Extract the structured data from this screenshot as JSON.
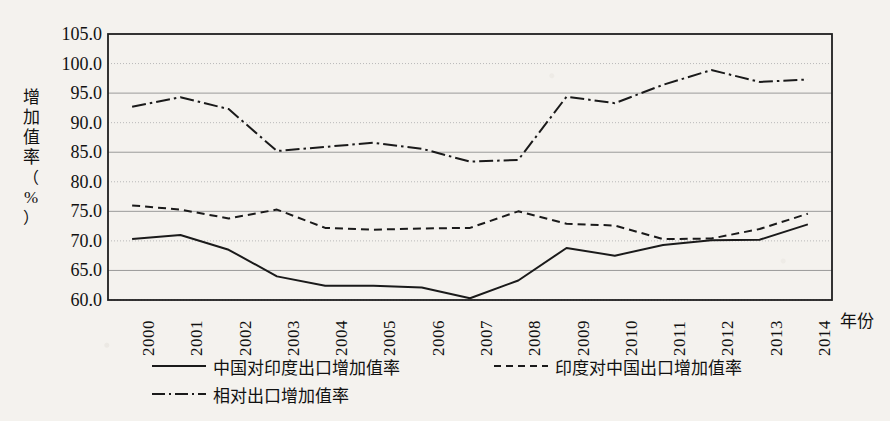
{
  "axes": {
    "y_label_chars": [
      "增",
      "加",
      "值",
      "率",
      "（",
      "%",
      "）"
    ],
    "y_label_full": "增加值率（%）",
    "x_title": "年份",
    "y_ticks": [
      "105.0",
      "100.0",
      "95.0",
      "90.0",
      "85.0",
      "80.0",
      "75.0",
      "70.0",
      "65.0",
      "60.0"
    ]
  },
  "legend": {
    "items": [
      {
        "label": "中国对印度出口增加值率",
        "style": "solid"
      },
      {
        "label": "印度对中国出口增加值率",
        "style": "dashed"
      },
      {
        "label": "相对出口增加值率",
        "style": "dashdot"
      }
    ]
  },
  "chart_data": {
    "type": "line",
    "title": "",
    "xlabel": "年份",
    "ylabel": "增加值率（%）",
    "xlim": [
      2000,
      2014
    ],
    "ylim": [
      60.0,
      105.0
    ],
    "ytick_step": 5.0,
    "grid": true,
    "legend_position": "below",
    "categories": [
      "2000",
      "2001",
      "2002",
      "2003",
      "2004",
      "2005",
      "2006",
      "2007",
      "2008",
      "2009",
      "2010",
      "2011",
      "2012",
      "2013",
      "2014"
    ],
    "series": [
      {
        "name": "中国对印度出口增加值率",
        "style": "solid",
        "color": "#1a1a1a",
        "values": [
          70.3,
          71.0,
          68.5,
          64.0,
          62.4,
          62.4,
          62.1,
          60.3,
          63.3,
          68.8,
          67.5,
          69.3,
          70.1,
          70.2,
          72.8
        ]
      },
      {
        "name": "印度对中国出口增加值率",
        "style": "dashed",
        "color": "#1a1a1a",
        "values": [
          76.0,
          75.3,
          73.8,
          75.3,
          72.2,
          71.9,
          72.1,
          72.2,
          75.0,
          72.9,
          72.6,
          70.3,
          70.4,
          72.0,
          74.6
        ]
      },
      {
        "name": "相对出口增加值率",
        "style": "dashdot",
        "color": "#1a1a1a",
        "values": [
          92.7,
          94.3,
          92.3,
          85.2,
          85.9,
          86.6,
          85.6,
          83.4,
          83.7,
          94.4,
          93.3,
          96.4,
          98.9,
          96.9,
          97.3
        ]
      }
    ]
  }
}
